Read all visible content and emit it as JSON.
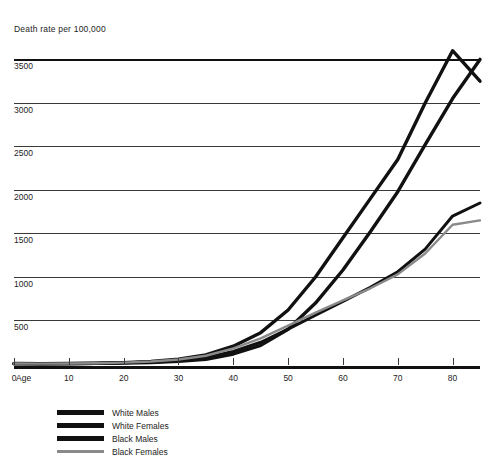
{
  "chart_data": {
    "type": "line",
    "title": "",
    "ylabel": "Death rate per 100,000",
    "xlabel": "Age",
    "xlim": [
      0,
      85
    ],
    "ylim": [
      0,
      3700
    ],
    "yticks": [
      500,
      1000,
      1500,
      2000,
      2500,
      3000,
      3500
    ],
    "ytick_labels": [
      "500",
      "1000",
      "1500",
      "2000",
      "2500",
      "3000",
      "3500"
    ],
    "xticks": [
      0,
      10,
      20,
      30,
      40,
      50,
      60,
      70,
      80
    ],
    "xtick_labels": [
      "0",
      "10",
      "20",
      "30",
      "40",
      "50",
      "60",
      "70",
      "80"
    ],
    "grid": true,
    "legend_position": "bottom-left",
    "x": [
      0,
      5,
      10,
      15,
      20,
      25,
      30,
      35,
      40,
      45,
      50,
      55,
      60,
      65,
      70,
      75,
      80,
      85
    ],
    "series": [
      {
        "name": "White Males",
        "color": "#111111",
        "width": 3.4,
        "values": [
          4,
          3,
          4,
          7,
          12,
          18,
          30,
          55,
          115,
          215,
          400,
          700,
          1080,
          1520,
          1980,
          2520,
          3050,
          3500
        ]
      },
      {
        "name": "White Females",
        "color": "#111111",
        "width": 3.0,
        "values": [
          4,
          3,
          4,
          7,
          13,
          22,
          40,
          75,
          145,
          250,
          400,
          560,
          720,
          880,
          1060,
          1320,
          1700,
          1850
        ]
      },
      {
        "name": "Black Males",
        "color": "#111111",
        "width": 3.4,
        "values": [
          5,
          4,
          5,
          9,
          16,
          28,
          55,
          105,
          205,
          360,
          620,
          1000,
          1450,
          1900,
          2350,
          3000,
          3600,
          3250
        ]
      },
      {
        "name": "Black Females",
        "color": "#8a8a8a",
        "width": 2.4,
        "values": [
          5,
          4,
          5,
          9,
          16,
          28,
          52,
          95,
          180,
          295,
          440,
          590,
          730,
          870,
          1030,
          1270,
          1600,
          1650
        ]
      }
    ]
  },
  "legend": {
    "items": [
      {
        "label": "White Males"
      },
      {
        "label": "White Females"
      },
      {
        "label": "Black Males"
      },
      {
        "label": "Black Females"
      }
    ]
  }
}
